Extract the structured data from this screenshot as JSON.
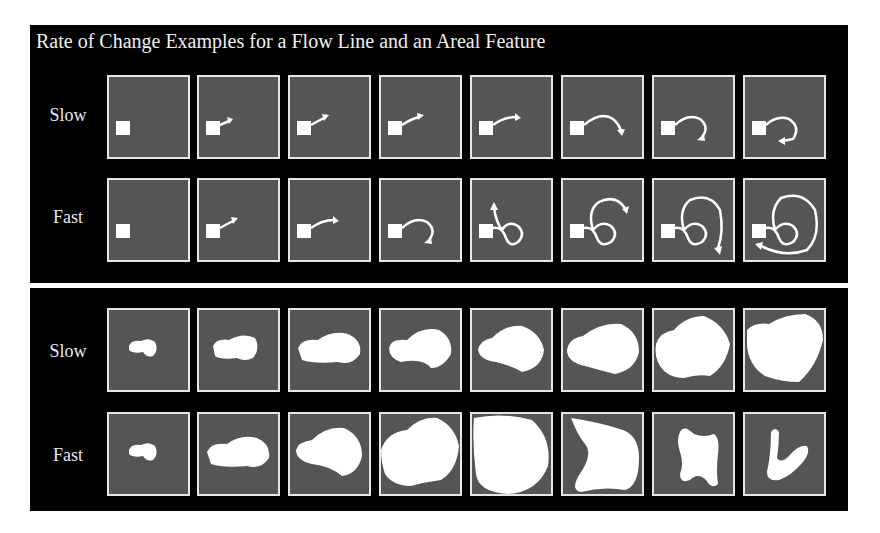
{
  "figure": {
    "title": "Rate of Change Examples for a Flow Line and an Areal Feature",
    "colors": {
      "background": "#000000",
      "cell_fill": "#555555",
      "cell_border": "#e6e6e6",
      "feature": "#ffffff"
    },
    "flow_line_panel": {
      "rows": [
        {
          "label": "Slow",
          "frames": 8
        },
        {
          "label": "Fast",
          "frames": 8
        }
      ]
    },
    "areal_feature_panel": {
      "rows": [
        {
          "label": "Slow",
          "frames": 8
        },
        {
          "label": "Fast",
          "frames": 8
        }
      ]
    }
  }
}
